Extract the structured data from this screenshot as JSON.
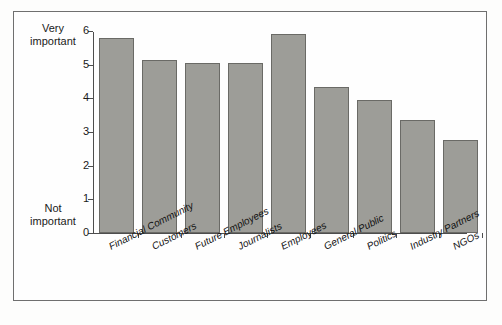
{
  "chart_data": {
    "type": "bar",
    "title": "",
    "subtitle": "",
    "xlabel": "",
    "ylabel": "",
    "ylim": [
      0,
      6
    ],
    "yticks": [
      0,
      1,
      2,
      3,
      4,
      5,
      6
    ],
    "ytick_labels": [
      "0",
      "1",
      "2",
      "3",
      "4",
      "5",
      "6"
    ],
    "y_axis_high_label": "Very important",
    "y_axis_low_label": "Not important",
    "grid": false,
    "legend": false,
    "bar_color": "#9d9d98",
    "bar_edge_color": "#6a6a66",
    "axis_color": "#4d4d4d",
    "categories": [
      "Financial Community",
      "Customers",
      "Future Employees",
      "Journalists",
      "Employees",
      "General Public",
      "Politics",
      "Industry Partners",
      "NGOs"
    ],
    "values": [
      5.8,
      5.15,
      5.05,
      5.05,
      5.9,
      4.35,
      3.95,
      3.35,
      2.75
    ]
  },
  "axis_notes": {
    "high_line1": "Very",
    "high_line2": "important",
    "low_line1": "Not",
    "low_line2": "important"
  }
}
